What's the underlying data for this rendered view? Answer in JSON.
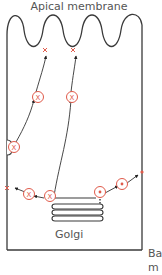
{
  "title": "Apical membrane",
  "labels": {
    "golgi": "Golgi",
    "basal": "Ba\nm"
  },
  "markers": {
    "x_symbol": "X",
    "dot_symbol": "•"
  },
  "colors": {
    "line": "#3a3a3a",
    "marker": "#e05a4a",
    "text": "#555555"
  }
}
